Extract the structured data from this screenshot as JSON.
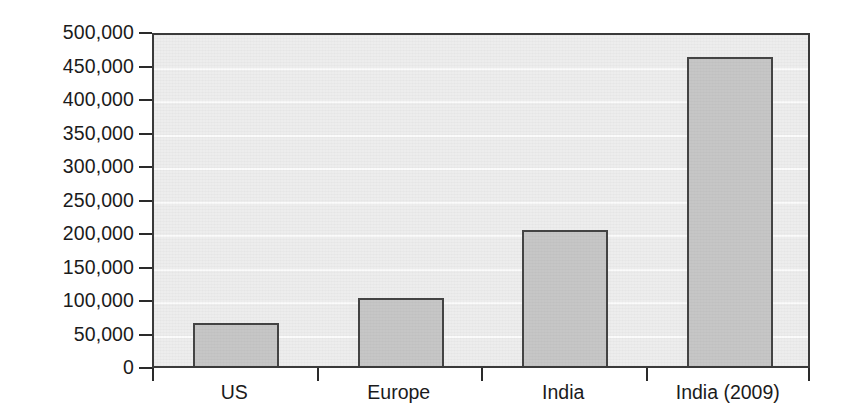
{
  "chart_data": {
    "type": "bar",
    "title": "",
    "subtitle": "",
    "xlabel": "",
    "ylabel": "",
    "categories": [
      "US",
      "Europe",
      "India",
      "India (2009)"
    ],
    "values": [
      64000,
      101000,
      203000,
      461000
    ],
    "series": [
      {
        "name": "",
        "values": [
          64000,
          101000,
          203000,
          461000
        ]
      }
    ],
    "ylim": [
      0,
      500000
    ],
    "ytick_values": [
      0,
      50000,
      100000,
      150000,
      200000,
      250000,
      300000,
      350000,
      400000,
      450000,
      500000
    ],
    "ytick_labels": [
      "0",
      "50,000",
      "100,000",
      "150,000",
      "200,000",
      "250,000",
      "300,000",
      "350,000",
      "400,000",
      "450,000",
      "500,000"
    ],
    "grid": true,
    "grid_axis": "y",
    "legend": false,
    "legend_position": "none",
    "annotations": [],
    "colors": {
      "bar_fill": "#c6c6c6",
      "bar_border": "#444444",
      "plot_background": "#ededed",
      "gridline": "#fbfbfb",
      "axis_line": "#3a3a3a",
      "text": "#1b1b1b",
      "page_background": "#ffffff"
    }
  }
}
